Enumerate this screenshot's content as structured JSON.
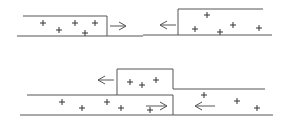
{
  "diagram": {
    "colors": {
      "line": "#555555",
      "plus": "#333333",
      "background": "#ffffff"
    },
    "panels": [
      {
        "name": "top-left",
        "lines": [
          [
            23,
            16,
            107,
            16
          ],
          [
            17,
            36,
            143,
            36
          ],
          [
            107,
            16,
            107,
            36
          ]
        ],
        "pluses": [
          [
            43,
            23
          ],
          [
            59,
            30
          ],
          [
            75,
            23
          ],
          [
            85,
            33
          ],
          [
            95,
            23
          ]
        ],
        "arrows": [
          {
            "dir": "right",
            "x1": 110,
            "x2": 126,
            "y": 26
          }
        ]
      },
      {
        "name": "top-right",
        "lines": [
          [
            178,
            9,
            263,
            9
          ],
          [
            143,
            35,
            272,
            35
          ],
          [
            178,
            9,
            178,
            35
          ]
        ],
        "pluses": [
          [
            207,
            15
          ],
          [
            195,
            29
          ],
          [
            220,
            32
          ],
          [
            233,
            25
          ],
          [
            259,
            28
          ]
        ],
        "arrows": [
          {
            "dir": "left",
            "x1": 160,
            "x2": 176,
            "y": 25
          }
        ]
      },
      {
        "name": "bottom",
        "lines": [
          [
            117,
            69,
            173,
            69
          ],
          [
            117,
            69,
            117,
            95
          ],
          [
            173,
            69,
            173,
            89
          ],
          [
            173,
            89,
            265,
            89
          ],
          [
            27,
            95,
            173,
            95
          ],
          [
            173,
            95,
            173,
            115
          ],
          [
            20,
            115,
            273,
            115
          ]
        ],
        "pluses": [
          [
            130,
            82
          ],
          [
            142,
            85
          ],
          [
            156,
            80
          ],
          [
            62,
            102
          ],
          [
            82,
            108
          ],
          [
            107,
            102
          ],
          [
            121,
            108
          ],
          [
            150,
            110
          ],
          [
            204,
            95
          ],
          [
            237,
            101
          ],
          [
            257,
            108
          ]
        ],
        "arrows": [
          {
            "dir": "left",
            "x1": 98,
            "x2": 114,
            "y": 80
          },
          {
            "dir": "right",
            "x1": 146,
            "x2": 167,
            "y": 106
          },
          {
            "dir": "left",
            "x1": 195,
            "x2": 215,
            "y": 106
          }
        ]
      }
    ]
  }
}
